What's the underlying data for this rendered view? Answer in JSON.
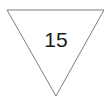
{
  "figure": {
    "type": "geometry-diagram",
    "background_color": "#ffffff",
    "width": 110,
    "height": 101,
    "shape": {
      "name": "inverted-triangle",
      "kind": "triangle",
      "orientation": "point-down",
      "stroke_color": "#7d7d7d",
      "fill_color": "#ffffff",
      "stroke_width": 1,
      "points": "7,10 104,10 56,96",
      "vertices": [
        {
          "label": "top-left",
          "x": 7,
          "y": 10
        },
        {
          "label": "top-right",
          "x": 104,
          "y": 10
        },
        {
          "label": "bottom",
          "x": 56,
          "y": 96
        }
      ]
    },
    "label": {
      "text": "15",
      "value": 15,
      "color": "#1c1c1c",
      "x": 56,
      "y": 39
    }
  }
}
